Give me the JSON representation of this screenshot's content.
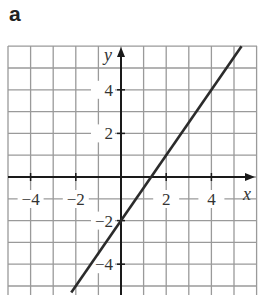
{
  "panel": {
    "label": "a"
  },
  "chart_data": {
    "type": "line",
    "title": "",
    "xlabel": "x",
    "ylabel": "y",
    "xlim": [
      -5,
      6
    ],
    "ylim": [
      -5.3,
      6
    ],
    "grid": true,
    "x_ticks": [
      -4,
      -2,
      2,
      4
    ],
    "y_ticks": [
      4,
      2,
      -2,
      -4
    ],
    "x_tick_labels": [
      "−4",
      "−2",
      "2",
      "4"
    ],
    "y_tick_labels": [
      "4",
      "2",
      "−2",
      "−4"
    ],
    "series": [
      {
        "name": "y = 1.5x − 2",
        "equation": "y = 1.5x - 2",
        "slope": 1.5,
        "intercept": -2,
        "points": [
          [
            -2.2,
            -5.3
          ],
          [
            0,
            -2
          ],
          [
            1.33,
            0
          ],
          [
            2,
            1
          ],
          [
            4,
            4
          ],
          [
            5.33,
            6
          ]
        ]
      }
    ],
    "colors": {
      "grid": "#9a9a9a",
      "axes": "#1a1a1a",
      "line": "#2b2b2b"
    }
  }
}
